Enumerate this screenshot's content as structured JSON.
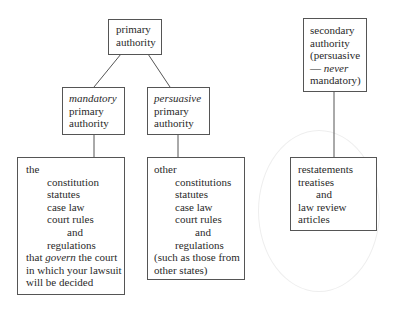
{
  "diagram": {
    "primary": {
      "lines": [
        "primary",
        "authority"
      ]
    },
    "mandatory": {
      "emph": "mandatory",
      "lines": [
        "primary",
        "authority"
      ]
    },
    "persuasive": {
      "emph": "persuasive",
      "lines": [
        "primary",
        "authority"
      ]
    },
    "mandatory_sources": {
      "intro": "the",
      "items": [
        "constitution",
        "statutes",
        "case law",
        "court rules"
      ],
      "conj": "and",
      "last": "regulations",
      "tail_pre": "that ",
      "tail_emph": "govern",
      "tail_post": " the court",
      "tail_lines": [
        "in which your lawsuit",
        "will be decided"
      ]
    },
    "persuasive_sources": {
      "intro": "other",
      "items": [
        "constitutions",
        "statutes",
        "case law",
        "court rules"
      ],
      "conj": "and",
      "last": "regulations",
      "tail_lines": [
        "(such as those from",
        "other states)"
      ]
    },
    "secondary": {
      "lines": [
        "secondary",
        "authority",
        "(persuasive"
      ],
      "dash": "— ",
      "emph": "never",
      "last": "mandatory)"
    },
    "secondary_sources": {
      "items": [
        "restatements",
        "treatises"
      ],
      "conj": "and",
      "tail_lines": [
        "law review",
        "articles"
      ]
    }
  },
  "colors": {
    "border": "#555555",
    "text": "#2a2a2a",
    "background": "#ffffff"
  }
}
